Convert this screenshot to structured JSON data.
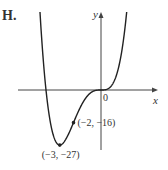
{
  "figure_label": "H.",
  "chart_data": {
    "type": "line",
    "title": "",
    "function": "y = x^4 + 4x^3",
    "xlabel": "x",
    "ylabel": "y",
    "xlim": [
      -5.5,
      4.2
    ],
    "ylim": [
      -30,
      40
    ],
    "grid": false,
    "origin_label": "0",
    "annotations": [
      {
        "x": -2,
        "y": -16,
        "text": "(−2, −16)"
      },
      {
        "x": -3,
        "y": -27,
        "text": "(−3, −27)"
      }
    ],
    "series": [
      {
        "name": "curve",
        "x_range": [
          -4.55,
          1.95
        ],
        "color": "#222222"
      }
    ]
  }
}
